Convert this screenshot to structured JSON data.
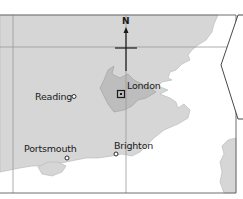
{
  "map": {
    "compass": {
      "label": "N"
    },
    "colors": {
      "land": "#d6d6d6",
      "urban": "#bdbdbd",
      "sea": "#ffffff",
      "grid": "#9a9a9a",
      "frame": "#6e6e6e",
      "text": "#1a1a1a"
    },
    "places": [
      {
        "name": "London",
        "marker": "square"
      },
      {
        "name": "Reading",
        "marker": "circle"
      },
      {
        "name": "Portsmouth",
        "marker": "circle"
      },
      {
        "name": "Brighton",
        "marker": "circle"
      }
    ]
  }
}
